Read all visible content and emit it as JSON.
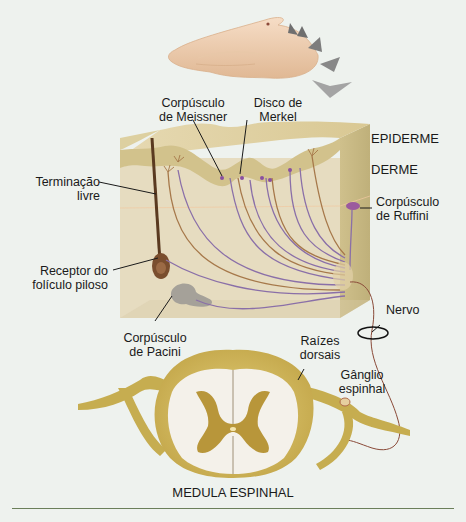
{
  "figure": {
    "labels": {
      "meissner": [
        "Corpúsculo",
        "de Meissner"
      ],
      "merkel": [
        "Disco de",
        "Merkel"
      ],
      "epiderme": "EPIDERME",
      "derme": "DERME",
      "terminacao": [
        "Terminação",
        "livre"
      ],
      "ruffini": [
        "Corpúsculo",
        "de Ruffini"
      ],
      "receptor_foliculo": [
        "Receptor do",
        "folículo piloso"
      ],
      "pacini": [
        "Corpúsculo",
        "de Pacini"
      ],
      "nervo": "Nervo",
      "raizes": [
        "Raízes",
        "dorsais"
      ],
      "ganglio": [
        "Gânglio",
        "espinhal"
      ],
      "medula": "MEDULA ESPINHAL"
    },
    "icons": {
      "hand": "hand-illustration",
      "pressure_arrows": "pressure-arrows",
      "skin_block": "skin-cross-section",
      "spinal_cord": "spinal-cord-cross-section"
    },
    "colors": {
      "background": "#eef2ee",
      "skin_light": "#e8dcb8",
      "skin_mid": "#d6c48f",
      "skin_dark": "#c4b06e",
      "nerve_purple": "#8a6fa8",
      "nerve_brown": "#a6784a",
      "hair": "#5a3a20",
      "cord_yellow": "#cdb455",
      "cord_grey_matter": "#b8963a",
      "white_matter": "#f4f1ea",
      "arrow_grey": "#7a7a7a",
      "rule": "#6b7f5a"
    }
  }
}
